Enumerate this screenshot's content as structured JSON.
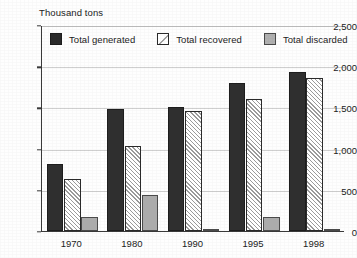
{
  "chart_data": {
    "type": "bar",
    "title": "Thousand tons",
    "xlabel": "",
    "ylabel": "Thousand tons",
    "categories": [
      "1970",
      "1980",
      "1990",
      "1995",
      "1998"
    ],
    "series": [
      {
        "name": "Total generated",
        "values": [
          810,
          1485,
          1500,
          1795,
          1925
        ],
        "color": "#2f2f2f",
        "pattern": "solid-dark"
      },
      {
        "name": "Total recovered",
        "values": [
          630,
          1030,
          1455,
          1600,
          1860
        ],
        "color": "#ffffff",
        "pattern": "diagonal-hatch"
      },
      {
        "name": "Total discarded",
        "values": [
          165,
          435,
          25,
          165,
          30
        ],
        "color": "#ababab",
        "pattern": "solid-gray"
      }
    ],
    "ylim": [
      0,
      2500
    ],
    "yticks": [
      0,
      500,
      1000,
      1500,
      2000,
      2500
    ],
    "ytick_labels": [
      "0",
      "500",
      "1,000",
      "1,500",
      "2,000",
      "2,500"
    ],
    "grid": true,
    "legend_position": "top-inside"
  },
  "legend": {
    "entries": [
      {
        "label": "Total generated",
        "swatch": "solid-dark-swatch"
      },
      {
        "label": "Total recovered",
        "swatch": "hatched-swatch"
      },
      {
        "label": "Total discarded",
        "swatch": "solid-gray-swatch"
      }
    ]
  },
  "colors": {
    "generated": "#2f2f2f",
    "recovered": "#ffffff",
    "discarded": "#ababab",
    "axis": "#3a3a3a",
    "grid": "#cfcfcf"
  }
}
